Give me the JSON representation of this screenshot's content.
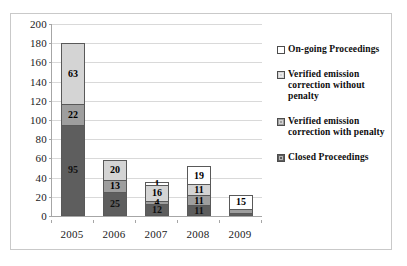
{
  "chart_data": {
    "type": "bar",
    "subtype": "stacked-bar",
    "title": "",
    "xlabel": "",
    "ylabel": "",
    "ylim": [
      0,
      200
    ],
    "ytick_step": 20,
    "yticks": [
      200,
      180,
      160,
      140,
      120,
      100,
      80,
      60,
      40,
      20,
      0
    ],
    "categories": [
      "2005",
      "2006",
      "2007",
      "2008",
      "2009"
    ],
    "grid": true,
    "legend_position": "right",
    "series": [
      {
        "name": "Closed Proceedings",
        "color": "#5e5e5e",
        "legend_index": 3,
        "stack_order": 0,
        "values": [
          95,
          25,
          12,
          11,
          1
        ]
      },
      {
        "name": "Verified emission correction with penalty",
        "color": "#9e9e9e",
        "legend_index": 2,
        "stack_order": 1,
        "values": [
          22,
          13,
          4,
          11,
          4
        ]
      },
      {
        "name": "Verified emission correction without penalty",
        "color": "#d4d4d4",
        "legend_index": 1,
        "stack_order": 2,
        "values": [
          63,
          20,
          16,
          11,
          0
        ]
      },
      {
        "name": "On-going Proceedings",
        "color": "#ffffff",
        "legend_index": 0,
        "stack_order": 3,
        "values": [
          0,
          0,
          1,
          19,
          15
        ]
      }
    ],
    "totals": [
      180,
      58,
      33,
      52,
      20
    ],
    "bars": [
      {
        "category": "2005",
        "total": 180,
        "segments": [
          {
            "series": "On-going Proceedings",
            "value": 0,
            "label": "",
            "color_class": "c0"
          },
          {
            "series": "Verified emission correction without penalty",
            "value": 63,
            "label": "63",
            "color_class": "c1"
          },
          {
            "series": "Verified emission correction with penalty",
            "value": 22,
            "label": "22",
            "color_class": "c2"
          },
          {
            "series": "Closed Proceedings",
            "value": 95,
            "label": "95",
            "color_class": "c3"
          }
        ]
      },
      {
        "category": "2006",
        "total": 58,
        "segments": [
          {
            "series": "On-going Proceedings",
            "value": 0,
            "label": "",
            "color_class": "c0"
          },
          {
            "series": "Verified emission correction without penalty",
            "value": 20,
            "label": "20",
            "color_class": "c1"
          },
          {
            "series": "Verified emission correction with penalty",
            "value": 13,
            "label": "13",
            "color_class": "c2"
          },
          {
            "series": "Closed Proceedings",
            "value": 25,
            "label": "25",
            "color_class": "c3"
          }
        ]
      },
      {
        "category": "2007",
        "total": 33,
        "segments": [
          {
            "series": "On-going Proceedings",
            "value": 1,
            "label": "1",
            "color_class": "c0"
          },
          {
            "series": "Verified emission correction without penalty",
            "value": 16,
            "label": "16",
            "color_class": "c1"
          },
          {
            "series": "Verified emission correction with penalty",
            "value": 4,
            "label": "4",
            "color_class": "c2"
          },
          {
            "series": "Closed Proceedings",
            "value": 12,
            "label": "12",
            "color_class": "c3"
          }
        ]
      },
      {
        "category": "2008",
        "total": 52,
        "segments": [
          {
            "series": "On-going Proceedings",
            "value": 19,
            "label": "19",
            "color_class": "c0"
          },
          {
            "series": "Verified emission correction without penalty",
            "value": 11,
            "label": "11",
            "color_class": "c1"
          },
          {
            "series": "Verified emission correction with penalty",
            "value": 11,
            "label": "11",
            "color_class": "c2"
          },
          {
            "series": "Closed Proceedings",
            "value": 11,
            "label": "11",
            "color_class": "c3"
          }
        ]
      },
      {
        "category": "2009",
        "total": 20,
        "segments": [
          {
            "series": "On-going Proceedings",
            "value": 15,
            "label": "15",
            "color_class": "c0"
          },
          {
            "series": "Verified emission correction without penalty",
            "value": 0,
            "label": "",
            "color_class": "c1"
          },
          {
            "series": "Verified emission correction with penalty",
            "value": 4,
            "label": "",
            "color_class": "c2"
          },
          {
            "series": "Closed Proceedings",
            "value": 1,
            "label": "",
            "color_class": "c3"
          }
        ]
      }
    ],
    "legend": [
      {
        "label": "On-going Proceedings",
        "color": "#ffffff",
        "color_class": "c0"
      },
      {
        "label": "Verified emission correction without penalty",
        "color": "#d4d4d4",
        "color_class": "c1"
      },
      {
        "label": "Verified emission correction with penalty",
        "color": "#9e9e9e",
        "color_class": "c2"
      },
      {
        "label": "Closed Proceedings",
        "color": "#5e5e5e",
        "color_class": "c3"
      }
    ]
  }
}
